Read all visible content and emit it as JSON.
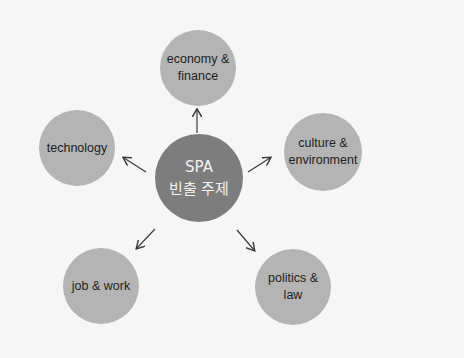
{
  "center": {
    "line1": "SPA",
    "line2": "빈출 주제"
  },
  "nodes": [
    {
      "id": "economy",
      "line1": "economy &",
      "line2": "finance"
    },
    {
      "id": "culture",
      "line1": "culture &",
      "line2": "environment"
    },
    {
      "id": "technology",
      "line1": "technology",
      "line2": ""
    },
    {
      "id": "job",
      "line1": "job & work",
      "line2": ""
    },
    {
      "id": "politics",
      "line1": "politics &",
      "line2": "law"
    }
  ],
  "colors": {
    "background": "#f6f6f6",
    "center": "#7d7d7d",
    "node": "#b4b4b4",
    "arrow": "#3a3a3a"
  }
}
